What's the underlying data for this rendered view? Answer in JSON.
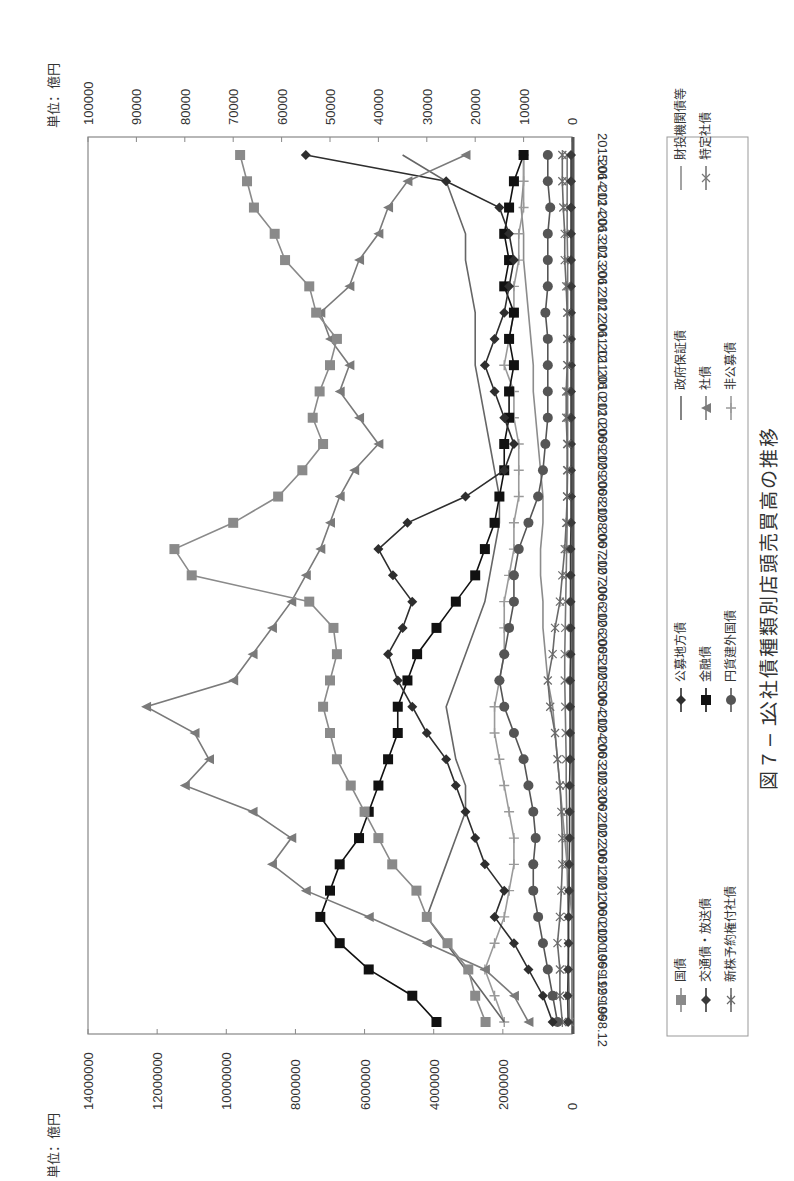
{
  "figure": {
    "caption_number": "図７−１",
    "caption_title": "公社債種類別店頭売買高の推移"
  },
  "axes": {
    "left_unit": "単位：億円",
    "right_unit": "単位：億円",
    "left_ticks": [
      "0",
      "2000000",
      "4000000",
      "6000000",
      "8000000",
      "10000000",
      "12000000",
      "14000000"
    ],
    "right_ticks": [
      "0",
      "10000",
      "20000",
      "30000",
      "40000",
      "50000",
      "60000",
      "70000",
      "80000",
      "90000",
      "100000"
    ]
  },
  "legend": [
    {
      "name": "国債",
      "marker": "square",
      "color": "#8a8a8a",
      "axis": "left"
    },
    {
      "name": "交通債・放送債",
      "marker": "diamond",
      "color": "#3a3a3a",
      "axis": "right"
    },
    {
      "name": "新株予約権付社債",
      "marker": "asterisk",
      "color": "#6a6a6a",
      "axis": "right"
    },
    {
      "name": "公募地方債",
      "marker": "diamond",
      "color": "#2e2e2e",
      "axis": "right"
    },
    {
      "name": "金融債",
      "marker": "square",
      "color": "#111111",
      "axis": "right"
    },
    {
      "name": "円貨建外国債",
      "marker": "circle",
      "color": "#555555",
      "axis": "right"
    },
    {
      "name": "政府保証債",
      "marker": "none",
      "color": "#666666",
      "axis": "right"
    },
    {
      "name": "社債",
      "marker": "triangle",
      "color": "#7a7a7a",
      "axis": "right"
    },
    {
      "name": "非公募債",
      "marker": "plus",
      "color": "#9a9a9a",
      "axis": "right"
    },
    {
      "name": "財投機関債等",
      "marker": "none",
      "color": "#8c8c8c",
      "axis": "right"
    },
    {
      "name": "特定社債",
      "marker": "x",
      "color": "#777777",
      "axis": "right"
    }
  ],
  "chart_data": {
    "type": "line",
    "xlabel": "",
    "ylabel_left": "単位：億円",
    "ylabel_right": "単位：億円",
    "ylim_left": [
      0,
      14000000
    ],
    "ylim_right": [
      0,
      100000
    ],
    "orientation": "rotated 90° clockwise on portrait page",
    "grid": false,
    "legend_position": "below plot (right side of page)",
    "categories": [
      "1998.12",
      "1999.06",
      "1999.12",
      "2000.06",
      "2000.12",
      "2001.06",
      "2001.12",
      "2002.06",
      "2002.12",
      "2003.06",
      "2003.12",
      "2004.06",
      "2004.12",
      "2005.06",
      "2005.12",
      "2006.06",
      "2006.12",
      "2007.06",
      "2007.12",
      "2008.06",
      "2008.12",
      "2009.06",
      "2009.12",
      "2010.06",
      "2010.12",
      "2011.06",
      "2011.12",
      "2012.06",
      "2012.12",
      "2013.06",
      "2013.12",
      "2014.06",
      "2014.12",
      "2015.06"
    ],
    "series": [
      {
        "name": "国債",
        "axis": "left",
        "values": [
          2500000,
          2800000,
          3000000,
          3600000,
          4200000,
          4500000,
          5200000,
          5600000,
          6000000,
          6400000,
          6800000,
          7000000,
          7200000,
          7000000,
          6800000,
          6900000,
          7600000,
          11000000,
          11500000,
          9800000,
          8500000,
          7800000,
          7200000,
          7500000,
          7300000,
          7000000,
          6800000,
          7400000,
          7600000,
          8300000,
          8600000,
          9200000,
          9400000,
          9600000
        ]
      },
      {
        "name": "交通債・放送債",
        "axis": "right",
        "values": [
          800,
          900,
          800,
          700,
          700,
          600,
          600,
          500,
          500,
          500,
          400,
          400,
          400,
          400,
          300,
          300,
          300,
          300,
          300,
          200,
          200,
          200,
          200,
          200,
          200,
          200,
          200,
          200,
          200,
          200,
          200,
          200,
          200,
          200
        ]
      },
      {
        "name": "新株予約権付社債",
        "axis": "right",
        "values": [
          2000,
          2500,
          2500,
          3000,
          2500,
          2200,
          2000,
          2000,
          2200,
          2500,
          3000,
          3500,
          4500,
          5000,
          4000,
          3500,
          2500,
          2000,
          1500,
          1200,
          1000,
          1000,
          1000,
          1200,
          1200,
          1000,
          1000,
          1000,
          1200,
          1500,
          1500,
          1800,
          2000,
          2000
        ]
      },
      {
        "name": "公募地方債",
        "axis": "right",
        "values": [
          4000,
          6000,
          9000,
          12000,
          16000,
          14000,
          18000,
          20000,
          22000,
          24000,
          26000,
          30000,
          33000,
          36000,
          38000,
          35000,
          33000,
          37000,
          40000,
          34000,
          22000,
          14000,
          12000,
          14000,
          16000,
          18000,
          16000,
          14000,
          13000,
          12000,
          13000,
          15000,
          26000,
          55000
        ]
      },
      {
        "name": "金融債",
        "axis": "right",
        "values": [
          28000,
          33000,
          42000,
          48000,
          52000,
          50000,
          48000,
          44000,
          42000,
          40000,
          38000,
          36000,
          36000,
          34000,
          32000,
          28000,
          24000,
          20000,
          18000,
          16000,
          15000,
          14000,
          14000,
          13000,
          13000,
          12000,
          13000,
          12000,
          14000,
          13000,
          14000,
          13000,
          12000,
          10000
        ]
      },
      {
        "name": "円貨建外国債",
        "axis": "right",
        "values": [
          3000,
          4000,
          5000,
          6000,
          7000,
          8000,
          8000,
          7500,
          8000,
          9000,
          10000,
          12000,
          14000,
          15000,
          14000,
          13000,
          12000,
          12000,
          11000,
          9000,
          7000,
          6000,
          5500,
          5000,
          5000,
          5000,
          5000,
          5500,
          5000,
          5000,
          5000,
          4500,
          5000,
          5000
        ]
      },
      {
        "name": "政府保証債",
        "axis": "right",
        "values": [
          14000,
          18000,
          22000,
          26000,
          30000,
          28000,
          26000,
          24000,
          22000,
          22000,
          24000,
          25000,
          26000,
          24000,
          22000,
          20000,
          18000,
          17000,
          16000,
          15000,
          15000,
          16000,
          17000,
          18000,
          19000,
          20000,
          20000,
          20000,
          21000,
          22000,
          22000,
          24000,
          26000,
          35000
        ]
      },
      {
        "name": "社債",
        "axis": "right",
        "values": [
          9000,
          12000,
          18000,
          30000,
          42000,
          55000,
          62000,
          58000,
          66000,
          80000,
          75000,
          78000,
          88000,
          70000,
          66000,
          62000,
          58000,
          55000,
          52000,
          50000,
          48000,
          45000,
          40000,
          44000,
          48000,
          46000,
          50000,
          52000,
          46000,
          44000,
          40000,
          38000,
          34000,
          22000
        ]
      },
      {
        "name": "非公募債",
        "axis": "right",
        "values": [
          14000,
          16000,
          18000,
          16000,
          14000,
          13000,
          12000,
          12000,
          13000,
          14000,
          15000,
          16000,
          16000,
          15000,
          14000,
          14000,
          14000,
          13000,
          12000,
          12000,
          11000,
          11000,
          11000,
          12000,
          12000,
          14000,
          13000,
          12000,
          12000,
          11000,
          11000,
          10000,
          10000,
          10000
        ]
      },
      {
        "name": "財投機関債等",
        "axis": "right",
        "values": [
          0,
          0,
          0,
          0,
          0,
          500,
          1000,
          1500,
          2000,
          2500,
          3000,
          3500,
          4000,
          5000,
          5500,
          6000,
          6000,
          6500,
          6500,
          6000,
          6000,
          6500,
          7000,
          7500,
          8000,
          8000,
          8500,
          9000,
          9500,
          10000,
          10000,
          10500,
          10000,
          10000
        ]
      },
      {
        "name": "特定社債",
        "axis": "right",
        "values": [
          500,
          600,
          700,
          800,
          800,
          900,
          1000,
          1000,
          1100,
          1200,
          1200,
          1300,
          1400,
          1500,
          1500,
          1400,
          1300,
          1200,
          1100,
          1000,
          1000,
          900,
          900,
          900,
          900,
          900,
          900,
          900,
          900,
          900,
          1000,
          1000,
          1000,
          1000
        ]
      }
    ]
  }
}
